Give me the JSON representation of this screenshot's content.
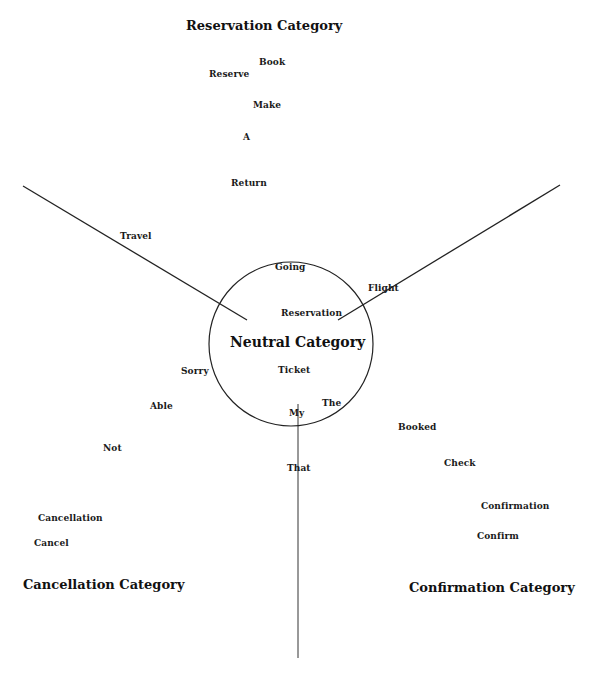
{
  "diagram": {
    "line_color": "#222222",
    "text_color": "#1a1a1a",
    "circle": {
      "cx": 291,
      "cy": 344,
      "r": 82
    },
    "lines": [
      {
        "name": "left-divider",
        "x1": 23,
        "y1": 186,
        "x2": 247,
        "y2": 320
      },
      {
        "name": "right-divider",
        "x1": 560,
        "y1": 185,
        "x2": 338,
        "y2": 320
      },
      {
        "name": "bottom-divider",
        "x1": 298,
        "y1": 404,
        "x2": 298,
        "y2": 658
      }
    ],
    "categories": {
      "reservation": "Reservation Category",
      "neutral": "Neutral Category",
      "cancellation": "Cancellation Category",
      "confirmation": "Confirmation Category"
    },
    "words": {
      "reservation": [
        "Book",
        "Reserve",
        "Make",
        "A",
        "Return",
        "Travel"
      ],
      "neutral": [
        "Going",
        "Flight",
        "Reservation",
        "Ticket",
        "Sorry",
        "The",
        "My"
      ],
      "cancellation": [
        "Able",
        "Not",
        "Cancellation",
        "Cancel"
      ],
      "confirmation": [
        "Booked",
        "Check",
        "Confirmation",
        "Confirm"
      ],
      "boundary": [
        "That"
      ]
    }
  }
}
